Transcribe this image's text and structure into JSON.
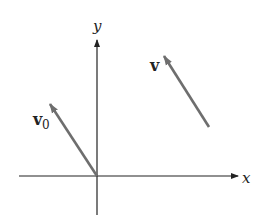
{
  "diagram": {
    "axes": {
      "x_label": "x",
      "y_label": "y"
    },
    "vectors": [
      {
        "label": "v",
        "subscript": "0",
        "from": [
          97,
          176
        ],
        "to": [
          49,
          103
        ]
      },
      {
        "label": "v",
        "subscript": "",
        "from": [
          209,
          127
        ],
        "to": [
          163,
          55
        ]
      }
    ],
    "colors": {
      "axis": "#222222",
      "vector": "#6e6e6e"
    }
  }
}
